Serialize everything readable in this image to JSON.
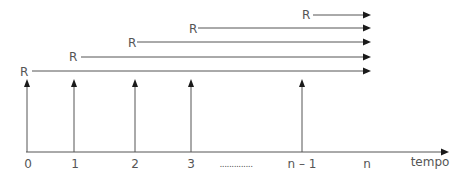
{
  "diagram": {
    "type": "cash-flow timeline",
    "axis_label": "tempo",
    "payment_label": "R",
    "period_labels": [
      "0",
      "1",
      "2",
      "3",
      "n – 1",
      "n"
    ],
    "ellipsis": "..............",
    "payments": [
      {
        "period": "0",
        "label": "R"
      },
      {
        "period": "1",
        "label": "R"
      },
      {
        "period": "2",
        "label": "R"
      },
      {
        "period": "3",
        "label": "R"
      },
      {
        "period": "n – 1",
        "label": "R"
      }
    ],
    "colors": {
      "line": "#555555",
      "arrowhead": "#1a1a1a",
      "text": "#555555"
    }
  }
}
